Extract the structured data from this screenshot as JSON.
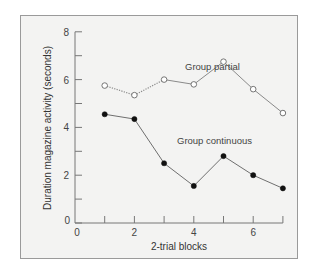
{
  "chart_data": {
    "type": "line",
    "title": "",
    "xlabel": "2-trial blocks",
    "ylabel": "Duration magazine activity (seconds)",
    "x": [
      1,
      2,
      3,
      4,
      5,
      6,
      7
    ],
    "xlim": [
      0,
      7
    ],
    "ylim": [
      0,
      8
    ],
    "xticks": [
      0,
      2,
      4,
      6
    ],
    "xminor_ticks": [
      1,
      3,
      5,
      7
    ],
    "yticks": [
      0,
      2,
      4,
      6,
      8
    ],
    "yminor_ticks": [
      1,
      3,
      5,
      7
    ],
    "grid": false,
    "legend": "inline labels",
    "series": [
      {
        "name": "Group partial",
        "values": [
          5.75,
          5.35,
          6.0,
          5.8,
          6.75,
          5.6,
          4.6
        ],
        "marker": "open-circle",
        "line_style": "dotted then solid",
        "color": "#888888"
      },
      {
        "name": "Group continuous",
        "values": [
          4.55,
          4.35,
          2.5,
          1.55,
          2.8,
          2.0,
          1.45
        ],
        "marker": "filled-circle",
        "line_style": "solid",
        "color": "#777777"
      }
    ]
  },
  "labels": {
    "xlabel": "2-trial blocks",
    "ylabel": "Duration magazine activity (seconds)",
    "partial": "Group partial",
    "continuous": "Group continuous",
    "x_origin": "0",
    "y_origin": "0"
  },
  "colors": {
    "panel_bg": "#f3f3f2",
    "panel_border": "#9a9a9a",
    "axis": "#777777",
    "marker_fill_continuous": "#111111",
    "marker_fill_partial": "#ffffff"
  }
}
